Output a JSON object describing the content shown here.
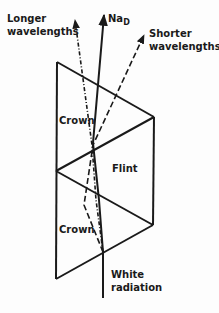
{
  "diagram": {
    "labels": {
      "longer_line1": "Longer",
      "longer_line2": "wavelengths",
      "na_main": "Na",
      "na_sub": "D",
      "shorter_line1": "Shorter",
      "shorter_line2": "wavelengths",
      "crown_top": "Crown",
      "flint": "Flint",
      "crown_bottom": "Crown",
      "white_line1": "White",
      "white_line2": "radiation"
    },
    "prisms": [
      {
        "name": "Crown",
        "position": "top"
      },
      {
        "name": "Flint",
        "position": "middle"
      },
      {
        "name": "Crown",
        "position": "bottom"
      }
    ],
    "rays": [
      {
        "name": "White radiation",
        "style": "solid"
      },
      {
        "name": "Longer wavelengths",
        "style": "dotted-dashed"
      },
      {
        "name": "Na D",
        "style": "solid"
      },
      {
        "name": "Shorter wavelengths",
        "style": "dashed"
      }
    ],
    "colors": {
      "ink": "#1a1a1a",
      "background": "#fdfdfd"
    }
  }
}
